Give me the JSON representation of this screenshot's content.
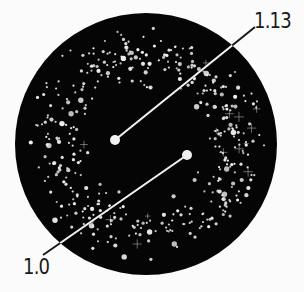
{
  "diagram": {
    "type": "star-field-disc",
    "colors": {
      "background": "#fbfbfb",
      "disc": "#050505",
      "stars": "#f2f2f2",
      "leader_lines": "#1a1a1a",
      "label_text": "#1a1a1a"
    },
    "disc": {
      "cx": 146,
      "cy": 144,
      "r": 131
    },
    "markers": [
      {
        "id": "marker-1-13",
        "label": "1.13",
        "point": {
          "x": 115,
          "y": 140,
          "r": 5
        },
        "line_end": {
          "x": 255,
          "y": 27
        }
      },
      {
        "id": "marker-1-0",
        "label": "1.0",
        "point": {
          "x": 187,
          "y": 155,
          "r": 5
        },
        "line_end": {
          "x": 43,
          "y": 255
        }
      }
    ],
    "star_field": {
      "count": 420,
      "sparkle_count": 14,
      "inner_radius_ratio": 0.28,
      "outer_radius_ratio": 0.93,
      "seed": 1337
    }
  }
}
